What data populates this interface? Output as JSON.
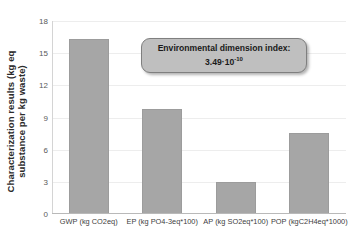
{
  "chart_data": {
    "type": "bar",
    "title": "",
    "xlabel": "",
    "ylabel": "Characterization results (kg eq\nsubstance per kg waste)",
    "ylim": [
      0,
      18
    ],
    "yticks": [
      0,
      3,
      6,
      9,
      12,
      15,
      18
    ],
    "ytick_labels": [
      "0",
      "3",
      "6",
      "9",
      "12",
      "15",
      "18"
    ],
    "grid": true,
    "legend": false,
    "bar_color": "#a6a6a6",
    "categories": [
      "GWP (kg CO2eq)",
      "EP (kg PO4-3eq*100)",
      "AP (kg SO2eq*100)",
      "POP (kgC2H4eq*1000)"
    ],
    "values": [
      16.3,
      9.8,
      3.0,
      7.6
    ],
    "annotations": [
      {
        "name": "environmental-dimension-index",
        "line1": "Environmental dimension index:",
        "mantissa": "3.49·10",
        "exponent": "-10"
      }
    ]
  }
}
